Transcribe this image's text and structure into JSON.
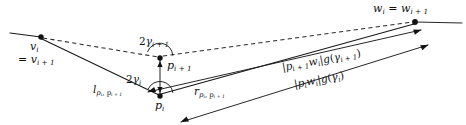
{
  "figure": {
    "type": "geometry-diagram",
    "background_color": "#ffffff",
    "ink_color": "#111111",
    "labels": {
      "v_vertex": "v",
      "v_vertex_sub": "i",
      "v_equality_eq": "=",
      "v_equality_base": "v",
      "v_equality_sub": "i + 1",
      "w_vertex": "w",
      "w_vertex_sub": "i",
      "w_equality_eq": "=",
      "w_equality_base": "w",
      "w_equality_sub": "i + 1",
      "angle_upper_coef": "2",
      "angle_upper_sym": "γ",
      "angle_upper_sub": "i + 1",
      "angle_lower_coef": "2",
      "angle_lower_sym": "γ",
      "angle_lower_sub": "i",
      "point_upper": "p",
      "point_upper_sub": "i + 1",
      "point_lower": "p",
      "point_lower_sub": "i",
      "left_edge_base": "l",
      "left_edge_sub": "p",
      "left_edge_sub2": "i",
      "left_edge_sub3": ", p",
      "left_edge_sub4": "i + 1",
      "right_edge_base": "r",
      "right_edge_sub": "p",
      "right_edge_sub2": "i",
      "right_edge_sub3": ", p",
      "right_edge_sub4": "i + 1",
      "dist_upper_bar_open": "|",
      "dist_upper_p": "p",
      "dist_upper_p_sub": "i + 1",
      "dist_upper_w": "w",
      "dist_upper_w_sub": "i",
      "dist_upper_bar_close": "|",
      "dist_upper_g": "g",
      "dist_upper_g_open": "(",
      "dist_upper_g_sym": "γ",
      "dist_upper_g_sub": "i + 1",
      "dist_upper_g_close": ")",
      "dist_lower_bar_open": "|",
      "dist_lower_p": "p",
      "dist_lower_p_sub": "i",
      "dist_lower_w": "w",
      "dist_lower_w_sub": "i",
      "dist_lower_bar_close": "|",
      "dist_lower_g": "g",
      "dist_lower_g_open": "(",
      "dist_lower_g_sym": "γ",
      "dist_lower_g_sub": "i",
      "dist_lower_g_close": ")"
    },
    "geometry": {
      "node_v": [
        41,
        37
      ],
      "node_p_upper": [
        160,
        58
      ],
      "node_p_lower": [
        160,
        96
      ],
      "node_w": [
        415,
        22
      ],
      "tail_left_start": [
        10,
        33
      ],
      "tail_right_end": [
        462,
        23
      ],
      "arrow_upper_tip": [
        421,
        30
      ],
      "arrow_lower_tip": [
        428,
        45
      ],
      "arrow_back_upper_tip": [
        144,
        92
      ],
      "arrow_back_lower_tip": [
        178,
        122
      ],
      "arc_upper_radius": 13,
      "arc_lower_radius": 13,
      "dot_radius": 2.6
    }
  }
}
